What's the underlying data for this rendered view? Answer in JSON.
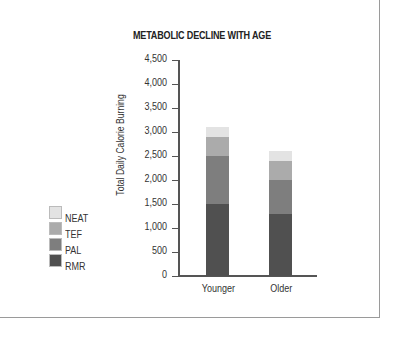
{
  "chart_data": {
    "type": "bar",
    "stacked": true,
    "title": "METABOLIC DECLINE WITH AGE",
    "xlabel": "",
    "ylabel": "Total Daily Calorie Burning",
    "categories": [
      "Younger",
      "Older"
    ],
    "series": [
      {
        "name": "RMR",
        "color": "#505050",
        "values": [
          1500,
          1300
        ]
      },
      {
        "name": "PAL",
        "color": "#7e7e7e",
        "values": [
          1000,
          700
        ]
      },
      {
        "name": "TEF",
        "color": "#ababab",
        "values": [
          400,
          400
        ]
      },
      {
        "name": "NEAT",
        "color": "#e3e3e3",
        "values": [
          200,
          200
        ]
      }
    ],
    "totals": [
      3100,
      2600
    ],
    "ylim": [
      0,
      4500
    ],
    "yticks": [
      0,
      500,
      1000,
      1500,
      2000,
      2500,
      3000,
      3500,
      4000,
      4500
    ],
    "ytick_labels": [
      "0",
      "500",
      "1,000",
      "1,500",
      "2,000",
      "2,500",
      "3,000",
      "3,500",
      "4,000",
      "4,500"
    ],
    "grid": false,
    "legend_position": "left",
    "legend_order": [
      "NEAT",
      "TEF",
      "PAL",
      "RMR"
    ]
  },
  "legend": [
    {
      "label": "NEAT",
      "color": "#e3e3e3"
    },
    {
      "label": "TEF",
      "color": "#ababab"
    },
    {
      "label": "PAL",
      "color": "#7e7e7e"
    },
    {
      "label": "RMR",
      "color": "#505050"
    }
  ]
}
